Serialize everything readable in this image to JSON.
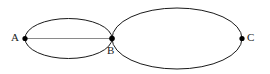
{
  "figure": {
    "background_color": "#ffffff",
    "stroke_color": "#1a1a1a",
    "chord_color": "#8a8a8a",
    "point_color": "#000000",
    "labels": {
      "a": "A",
      "b": "B",
      "c": "C"
    },
    "shapes": [
      {
        "name": "left-ellipse",
        "type": "ellipse",
        "cx": 68.5,
        "cy": 38.5,
        "rx": 43.5,
        "ry": 20.0,
        "stroke_width": 1.0
      },
      {
        "name": "right-ellipse",
        "type": "ellipse",
        "cx": 177.0,
        "cy": 38.5,
        "rx": 65.0,
        "ry": 30.5,
        "stroke_width": 1.0
      },
      {
        "name": "chord-ab",
        "type": "line",
        "x1": 25.0,
        "y1": 38.5,
        "x2": 112.0,
        "y2": 38.5,
        "stroke_width": 1.0
      }
    ],
    "points": [
      {
        "name": "point-a",
        "label": "A",
        "x": 25.0,
        "y": 38.5,
        "r": 2.6
      },
      {
        "name": "point-b",
        "label": "B",
        "x": 112.0,
        "y": 38.5,
        "r": 2.8
      },
      {
        "name": "point-c",
        "label": "C",
        "x": 242.0,
        "y": 38.5,
        "r": 2.6
      }
    ]
  }
}
